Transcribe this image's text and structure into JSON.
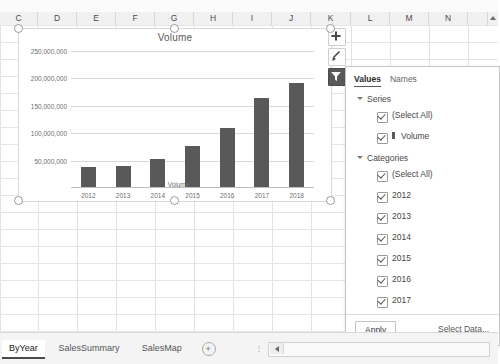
{
  "spreadsheet": {
    "columns": [
      "C",
      "D",
      "E",
      "F",
      "G",
      "H",
      "I",
      "J",
      "K",
      "L",
      "M",
      "N"
    ],
    "scroll_up_icon": "triangle-up-icon"
  },
  "chart": {
    "title": "Volume",
    "legend_label": "Volume",
    "selected": true,
    "side_buttons": [
      {
        "name": "chart-elements-button",
        "icon": "plus-icon",
        "label": "+",
        "active": false
      },
      {
        "name": "chart-styles-button",
        "icon": "brush-icon",
        "label": "",
        "active": false
      },
      {
        "name": "chart-filters-button",
        "icon": "funnel-icon",
        "label": "",
        "active": true
      }
    ]
  },
  "chart_data": {
    "type": "bar",
    "title": "Volume",
    "categories": [
      "2012",
      "2013",
      "2014",
      "2015",
      "2016",
      "2017",
      "2018"
    ],
    "series": [
      {
        "name": "Volume",
        "values": [
          37000000,
          39000000,
          52000000,
          75000000,
          107000000,
          163000000,
          190000000
        ]
      }
    ],
    "ytick_labels": [
      "250,000,000",
      "200,000,000",
      "150,000,000",
      "100,000,000",
      "50,000,000"
    ],
    "ytick_values": [
      250000000,
      200000000,
      150000000,
      100000000,
      50000000
    ],
    "ylim": [
      0,
      250000000
    ],
    "xlabel": "",
    "ylabel": "",
    "grid": true,
    "legend": [
      "Volume"
    ],
    "legend_position": "bottom",
    "bar_color": "#595959"
  },
  "filter_panel": {
    "tabs": [
      {
        "label": "Values",
        "active": true
      },
      {
        "label": "Names",
        "active": false
      }
    ],
    "groups": [
      {
        "label": "Series",
        "expand_icon": "triangle-down-icon",
        "items": [
          {
            "label": "(Select All)",
            "checked": true,
            "swatch": false
          },
          {
            "label": "Volume",
            "checked": true,
            "swatch": true
          }
        ]
      },
      {
        "label": "Categories",
        "expand_icon": "triangle-down-icon",
        "items": [
          {
            "label": "(Select All)",
            "checked": true,
            "swatch": false
          },
          {
            "label": "2012",
            "checked": true,
            "swatch": false
          },
          {
            "label": "2013",
            "checked": true,
            "swatch": false
          },
          {
            "label": "2014",
            "checked": true,
            "swatch": false
          },
          {
            "label": "2015",
            "checked": true,
            "swatch": false
          },
          {
            "label": "2016",
            "checked": true,
            "swatch": false
          },
          {
            "label": "2017",
            "checked": true,
            "swatch": false
          },
          {
            "label": "2018",
            "checked": true,
            "swatch": false
          }
        ]
      }
    ],
    "apply_label": "Apply",
    "select_data_label": "Select Data..."
  },
  "sheet_tabs": {
    "tabs": [
      {
        "label": "ByYear",
        "active": true
      },
      {
        "label": "SalesSummary",
        "active": false
      },
      {
        "label": "SalesMap",
        "active": false
      }
    ],
    "add_sheet_icon": "plus-circle-icon",
    "scroll_left_icon": "triangle-left-icon"
  }
}
